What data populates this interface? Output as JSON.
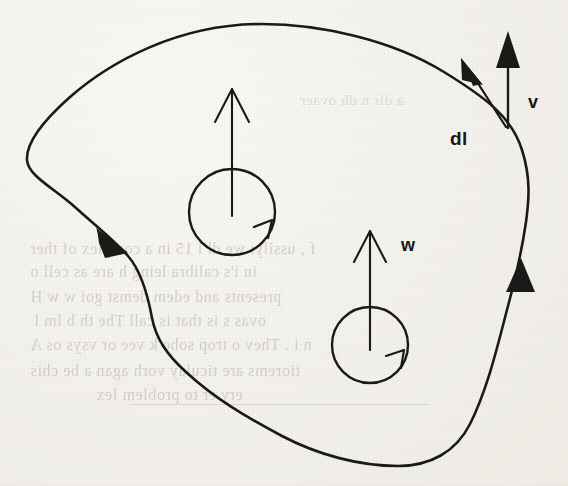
{
  "figure": {
    "kind": "vector-field-circulation-diagram",
    "background_color": "#f5f3ef",
    "ink_color": "#1c1a19"
  },
  "labels": {
    "dl": "dl",
    "v": "v",
    "w": "w"
  },
  "annotations": {
    "boundary_point": {
      "x": 505,
      "y": 124
    },
    "dl_arrow": {
      "from_x": 505,
      "from_y": 124,
      "to_x": 463,
      "to_y": 61,
      "semantic": "tangent-line-element"
    },
    "v_arrow": {
      "from_x": 508,
      "from_y": 124,
      "to_x": 508,
      "to_y": 34,
      "semantic": "field-vector-v"
    },
    "orientation_arrowheads": [
      {
        "x": 112,
        "y": 243,
        "angle_deg": 40,
        "semantic": "curve-direction-left"
      },
      {
        "x": 519,
        "y": 277,
        "angle_deg": -95,
        "semantic": "curve-direction-right"
      }
    ],
    "circulation_loops": [
      {
        "cx": 232,
        "cy": 212,
        "r": 43,
        "vector_label": "",
        "vector_top_y": 93,
        "semantic": "upper-curl-loop"
      },
      {
        "cx": 370,
        "cy": 345,
        "r": 38,
        "vector_label": "w",
        "vector_top_y": 228,
        "semantic": "lower-curl-loop"
      }
    ]
  },
  "bleed_through": {
    "note": "faint mirror-reversed text showing through from the reverse page",
    "lines": [
      {
        "text": "a  dlr  n dh  ovaer",
        "x": 300,
        "y": 92,
        "size": 15
      },
      {
        "text": "f , ussily: we   dl  i 15  in a complex of ther",
        "x": 30,
        "y": 240,
        "size": 16
      },
      {
        "text": "in  i's calibra  leing  h  are as cell  o",
        "x": 30,
        "y": 263,
        "size": 16
      },
      {
        "text": "presents and edem  demst goi w   w  H",
        "x": 30,
        "y": 288,
        "size": 16
      },
      {
        "text": "ovas   s   is  that is call The th   b  lm  l",
        "x": 34,
        "y": 312,
        "size": 16
      },
      {
        "text": "n i . Thev  o trop sobe  k  vee or vsys os  A",
        "x": 30,
        "y": 336,
        "size": 16
      },
      {
        "text": "tiorems  are ticulay  vorh agan a  be  chis",
        "x": 30,
        "y": 362,
        "size": 16
      },
      {
        "text": "erv  er to  problem  lex",
        "x": 96,
        "y": 386,
        "size": 16
      }
    ],
    "rules": [
      {
        "x": 130,
        "y": 404,
        "width": 300
      }
    ]
  }
}
